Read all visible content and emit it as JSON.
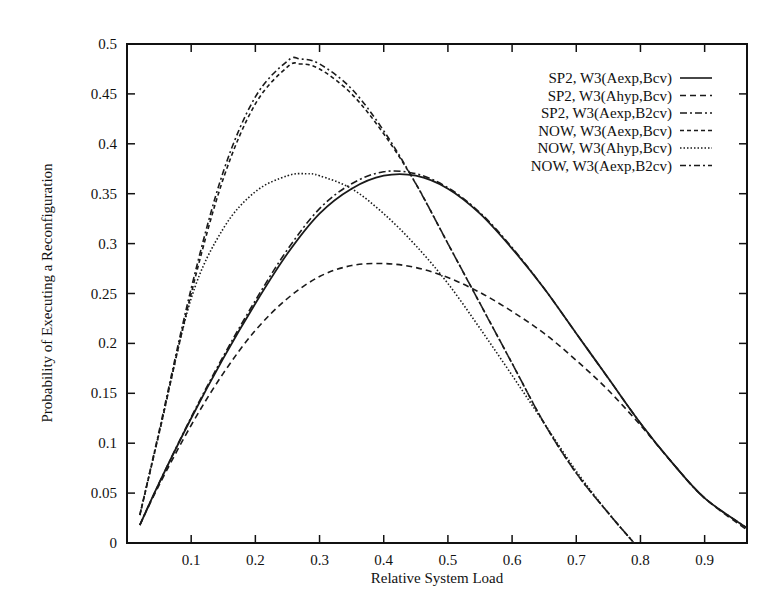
{
  "chart_data": {
    "type": "line",
    "title": "",
    "xlabel": "Relative System Load",
    "ylabel": "Probability of Executing a Reconfiguration",
    "xlim": [
      0.0,
      0.966
    ],
    "ylim": [
      0,
      0.5
    ],
    "grid": false,
    "legend_position": "top-right",
    "x_ticks": [
      0.1,
      0.2,
      0.3,
      0.4,
      0.5,
      0.6,
      0.7,
      0.8,
      0.9
    ],
    "x_tick_labels": [
      "0.1",
      "0.2",
      "0.3",
      "0.4",
      "0.5",
      "0.6",
      "0.7",
      "0.8",
      "0.9"
    ],
    "y_ticks": [
      0,
      0.05,
      0.1,
      0.15,
      0.2,
      0.25,
      0.3,
      0.35,
      0.4,
      0.45,
      0.5
    ],
    "y_tick_labels": [
      "0",
      "0.05",
      "0.1",
      "0.15",
      "0.2",
      "0.25",
      "0.3",
      "0.35",
      "0.4",
      "0.45",
      "0.5"
    ],
    "series": [
      {
        "name": "SP2,  W3(Aexp,Bcv)",
        "dash": "solid",
        "x": [
          0.02,
          0.05,
          0.1,
          0.15,
          0.2,
          0.25,
          0.3,
          0.35,
          0.4,
          0.45,
          0.5,
          0.55,
          0.6,
          0.65,
          0.7,
          0.75,
          0.8,
          0.85,
          0.9,
          0.966
        ],
        "y": [
          0.018,
          0.06,
          0.125,
          0.185,
          0.24,
          0.29,
          0.33,
          0.355,
          0.368,
          0.368,
          0.355,
          0.33,
          0.295,
          0.255,
          0.21,
          0.165,
          0.12,
          0.08,
          0.045,
          0.015
        ]
      },
      {
        "name": "SP2,  W3(Ahyp,Bcv)",
        "dash": "longdash",
        "x": [
          0.02,
          0.05,
          0.1,
          0.15,
          0.2,
          0.25,
          0.3,
          0.35,
          0.4,
          0.45,
          0.5,
          0.55,
          0.6,
          0.65,
          0.7,
          0.75,
          0.8,
          0.85,
          0.9,
          0.966
        ],
        "y": [
          0.018,
          0.058,
          0.118,
          0.17,
          0.213,
          0.245,
          0.267,
          0.278,
          0.28,
          0.276,
          0.266,
          0.251,
          0.232,
          0.21,
          0.183,
          0.153,
          0.118,
          0.08,
          0.045,
          0.013
        ]
      },
      {
        "name": "SP2,  W3(Aexp,B2cv)",
        "dash": "dashdot",
        "x": [
          0.02,
          0.05,
          0.1,
          0.15,
          0.2,
          0.25,
          0.3,
          0.35,
          0.4,
          0.45,
          0.5,
          0.55,
          0.6,
          0.65,
          0.7,
          0.75,
          0.8,
          0.85,
          0.9,
          0.966
        ],
        "y": [
          0.018,
          0.06,
          0.126,
          0.187,
          0.243,
          0.294,
          0.335,
          0.36,
          0.372,
          0.37,
          0.356,
          0.331,
          0.296,
          0.255,
          0.21,
          0.165,
          0.12,
          0.08,
          0.045,
          0.015
        ]
      },
      {
        "name": "NOW,  W3(Aexp,Bcv)",
        "dash": "shortdash",
        "x": [
          0.02,
          0.05,
          0.1,
          0.15,
          0.2,
          0.25,
          0.27,
          0.3,
          0.35,
          0.4,
          0.45,
          0.5,
          0.55,
          0.6,
          0.65,
          0.7,
          0.75,
          0.79
        ],
        "y": [
          0.028,
          0.11,
          0.25,
          0.365,
          0.44,
          0.477,
          0.48,
          0.475,
          0.45,
          0.41,
          0.36,
          0.3,
          0.24,
          0.18,
          0.12,
          0.07,
          0.03,
          0.0
        ]
      },
      {
        "name": "NOW,  W3(Ahyp,Bcv)",
        "dash": "dotted",
        "x": [
          0.02,
          0.05,
          0.1,
          0.15,
          0.2,
          0.25,
          0.28,
          0.3,
          0.35,
          0.4,
          0.45,
          0.5,
          0.55,
          0.6,
          0.65,
          0.7,
          0.75,
          0.79
        ],
        "y": [
          0.028,
          0.11,
          0.245,
          0.315,
          0.352,
          0.368,
          0.37,
          0.368,
          0.355,
          0.33,
          0.298,
          0.26,
          0.215,
          0.168,
          0.12,
          0.072,
          0.03,
          0.0
        ]
      },
      {
        "name": "NOW,  W3(Aexp,B2cv)",
        "dash": "dashdotdot",
        "x": [
          0.02,
          0.05,
          0.1,
          0.15,
          0.2,
          0.25,
          0.27,
          0.3,
          0.35,
          0.4,
          0.45,
          0.5,
          0.55,
          0.6,
          0.65,
          0.7,
          0.75,
          0.79
        ],
        "y": [
          0.028,
          0.112,
          0.255,
          0.372,
          0.447,
          0.483,
          0.485,
          0.48,
          0.455,
          0.413,
          0.36,
          0.3,
          0.24,
          0.18,
          0.12,
          0.07,
          0.03,
          0.0
        ]
      }
    ]
  },
  "chart": {
    "xlabel": "Relative System Load",
    "ylabel": "Probability of Executing a Reconfiguration"
  }
}
